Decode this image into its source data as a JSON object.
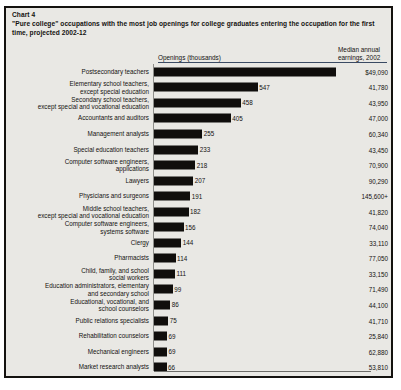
{
  "chart": {
    "number_label": "Chart 4",
    "title": "\"Pure college\" occupations with the most job openings for college graduates entering the occupation for the first time, projected 2002-12",
    "column_header_openings": "Openings (thousands)",
    "column_header_earnings": "Median annual\nearnings, 2002"
  },
  "chart_data": {
    "type": "bar",
    "orientation": "horizontal",
    "title": "\"Pure college\" occupations with the most job openings for college graduates entering the occupation for the first time, projected 2002-12",
    "xlabel": "Openings (thousands)",
    "ylabel": "",
    "xlim": [
      0,
      1000
    ],
    "grid": false,
    "legend": null,
    "categories": [
      "Postsecondary teachers",
      "Elementary school teachers,\nexcept special education",
      "Secondary school teachers,\nexcept special and vocational education",
      "Accountants and auditors",
      "Management analysts",
      "Special education teachers",
      "Computer software engineers,\napplications",
      "Lawyers",
      "Physicians and surgeons",
      "Middle school teachers,\nexcept special and vocational education",
      "Computer software engineers,\nsystems software",
      "Clergy",
      "Pharmacists",
      "Child, family, and school\nsocial workers",
      "Education administrators, elementary\nand secondary school",
      "Educational, vocational, and\nschool counselors",
      "Public relations specialists",
      "Rehabilitation counselors",
      "Mechanical engineers",
      "Market research analysts"
    ],
    "values": [
      960,
      547,
      458,
      405,
      255,
      233,
      218,
      207,
      191,
      182,
      156,
      144,
      114,
      111,
      99,
      86,
      75,
      69,
      69,
      66
    ],
    "value_labels": [
      "960",
      "547",
      "458",
      "405",
      "255",
      "233",
      "218",
      "207",
      "191",
      "182",
      "156",
      "144",
      "114",
      "111",
      "99",
      "86",
      "75",
      "69",
      "69",
      "66"
    ],
    "secondary_series": {
      "name": "Median annual earnings, 2002",
      "labels": [
        "$49,090",
        "41,780",
        "43,950",
        "47,000",
        "60,340",
        "43,450",
        "70,900",
        "90,290",
        "145,600+",
        "41,820",
        "74,040",
        "33,110",
        "77,050",
        "33,150",
        "71,490",
        "44,100",
        "41,710",
        "25,840",
        "62,880",
        "53,810"
      ],
      "values": [
        49090,
        41780,
        43950,
        47000,
        60340,
        43450,
        70900,
        90290,
        145600,
        41820,
        74040,
        33110,
        77050,
        33150,
        71490,
        44100,
        41710,
        25840,
        62880,
        53810
      ]
    }
  },
  "colors": {
    "bar": "#100e0c",
    "background": "#e9e8e4",
    "border": "#14120f",
    "rule": "#3a4a63"
  }
}
